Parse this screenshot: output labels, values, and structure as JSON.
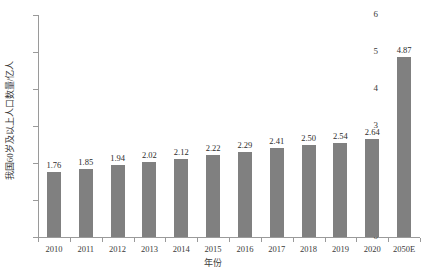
{
  "chart_data": {
    "type": "bar",
    "title": "",
    "xlabel": "年份",
    "ylabel": "我国60岁及以上人口数量/亿人",
    "categories": [
      "2010",
      "2011",
      "2012",
      "2013",
      "2014",
      "2015",
      "2016",
      "2017",
      "2018",
      "2019",
      "2020",
      "2050E"
    ],
    "values": [
      1.76,
      1.85,
      1.94,
      2.02,
      2.12,
      2.22,
      2.29,
      2.41,
      2.5,
      2.54,
      2.64,
      4.87
    ],
    "value_labels": [
      "1.76",
      "1.85",
      "1.94",
      "2.02",
      "2.12",
      "2.22",
      "2.29",
      "2.41",
      "2.50",
      "2.54",
      "2.64",
      "4.87"
    ],
    "ylim": [
      0,
      6
    ],
    "yticks": [
      0,
      1,
      2,
      3,
      4,
      5,
      6
    ],
    "ytick_labels": [
      "0",
      "1",
      "2",
      "3",
      "4",
      "5",
      "6"
    ],
    "grid": false,
    "legend": "none",
    "bar_color": "#808080",
    "axis_color": "#9a9a9a",
    "text_color": "#3a3a3a"
  }
}
